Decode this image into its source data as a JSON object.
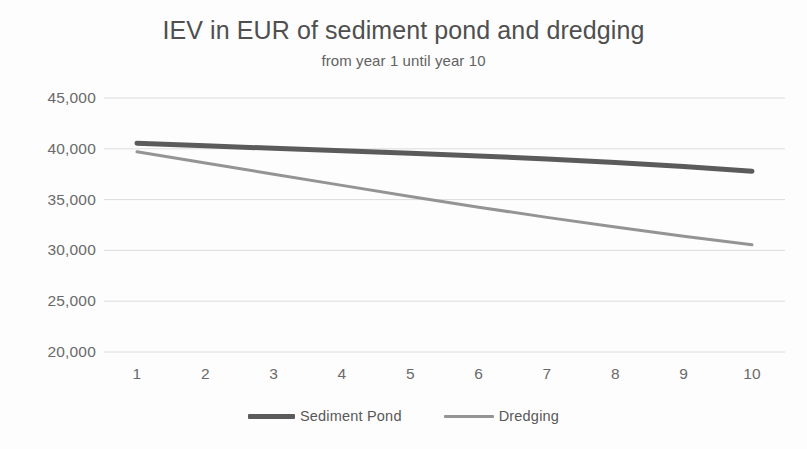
{
  "chart_data": {
    "type": "line",
    "title": "IEV in EUR of sediment pond and dredging",
    "subtitle": "from year 1 until year 10",
    "xlabel": "",
    "ylabel": "",
    "x": [
      1,
      2,
      3,
      4,
      5,
      6,
      7,
      8,
      9,
      10
    ],
    "categories": [
      "1",
      "2",
      "3",
      "4",
      "5",
      "6",
      "7",
      "8",
      "9",
      "10"
    ],
    "xtick_labels": [
      "1",
      "2",
      "3",
      "4",
      "5",
      "6",
      "7",
      "8",
      "9",
      "10"
    ],
    "ytick_labels": [
      "45,000",
      "40,000",
      "35,000",
      "30,000",
      "25,000",
      "20,000"
    ],
    "ytick_values": [
      45000,
      40000,
      35000,
      30000,
      25000,
      20000
    ],
    "ylim": [
      20000,
      45000
    ],
    "xlim": [
      1,
      10
    ],
    "grid": "horizontal",
    "legend_position": "bottom",
    "series": [
      {
        "name": "Sediment Pond",
        "color": "#5b5b5b",
        "line_width": 5,
        "values": [
          40550,
          40300,
          40050,
          39800,
          39550,
          39300,
          39000,
          38650,
          38250,
          37800
        ]
      },
      {
        "name": "Dredging",
        "color": "#949494",
        "line_width": 3,
        "values": [
          39700,
          38600,
          37500,
          36400,
          35300,
          34250,
          33250,
          32300,
          31400,
          30550
        ]
      }
    ]
  },
  "legend": {
    "items": [
      {
        "label": "Sediment Pond"
      },
      {
        "label": "Dredging"
      }
    ]
  },
  "colors": {
    "background": "#fdfdfd",
    "gridline": "#dcdcdc",
    "tick_text": "#6a6a6a",
    "title_text": "#4f4f4f",
    "subtitle_text": "#626262",
    "series_sediment_pond": "#5b5b5b",
    "series_dredging": "#949494"
  }
}
